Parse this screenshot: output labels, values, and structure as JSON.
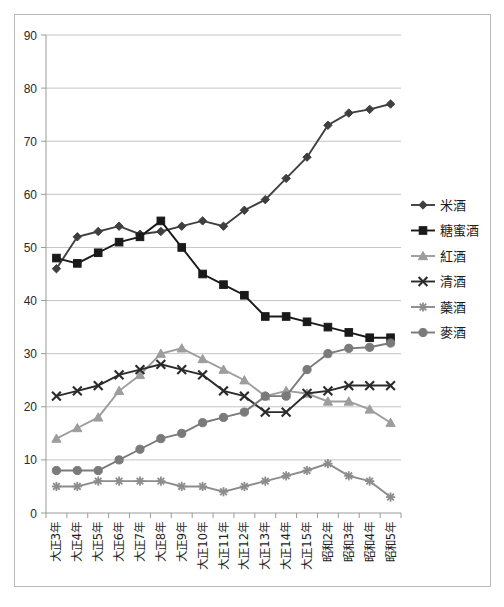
{
  "chart_data": {
    "type": "line",
    "title": "",
    "subtitle": "",
    "xlabel": "",
    "ylabel": "",
    "ylim": [
      0,
      90
    ],
    "ytick_step": 10,
    "yticks": [
      0,
      10,
      20,
      30,
      40,
      50,
      60,
      70,
      80,
      90
    ],
    "grid": true,
    "legend_position": "right",
    "categories": [
      "大正3年",
      "大正4年",
      "大正5年",
      "大正6年",
      "大正7年",
      "大正8年",
      "大正9年",
      "大正10年",
      "大正11年",
      "大正12年",
      "大正13年",
      "大正14年",
      "大正15年",
      "昭和2年",
      "昭和3年",
      "昭和4年",
      "昭和5年"
    ],
    "series": [
      {
        "name": "米酒",
        "marker": "diamond",
        "color": "#3f3f3f",
        "values": [
          46,
          52,
          53,
          54,
          52.5,
          53,
          54,
          55,
          54,
          57,
          59,
          63,
          67,
          73,
          75.3,
          76,
          77
        ]
      },
      {
        "name": "糖蜜酒",
        "marker": "square",
        "color": "#1a1a1a",
        "values": [
          48,
          47,
          49,
          51,
          52,
          55,
          50,
          45,
          43,
          41,
          37,
          37,
          36,
          35,
          34,
          33,
          33
        ]
      },
      {
        "name": "紅酒",
        "marker": "triangle",
        "color": "#9d9d9d",
        "values": [
          14,
          16,
          18,
          23,
          26,
          30,
          31,
          29,
          27,
          25,
          22,
          23,
          22.5,
          21,
          21,
          19.5,
          17
        ]
      },
      {
        "name": "清酒",
        "marker": "x",
        "color": "#2b2b2b",
        "values": [
          22,
          23,
          24,
          26,
          27,
          28,
          27,
          26,
          23,
          22,
          19,
          19,
          22.5,
          23,
          24,
          24,
          24
        ]
      },
      {
        "name": "藥酒",
        "marker": "asterisk",
        "color": "#8c8c8c",
        "values": [
          5,
          5,
          6,
          6,
          6,
          6,
          5,
          5,
          4,
          5,
          6,
          7,
          8,
          9.3,
          7,
          6,
          3
        ]
      },
      {
        "name": "麥酒",
        "marker": "circle",
        "color": "#7a7a7a",
        "values": [
          8,
          8,
          8,
          10,
          12,
          14,
          15,
          17,
          18,
          19,
          22,
          22,
          27,
          30,
          31,
          31.2,
          32
        ]
      }
    ]
  }
}
